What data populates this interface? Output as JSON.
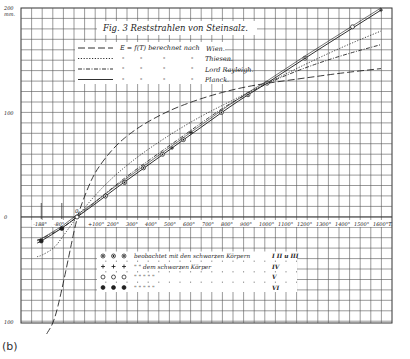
{
  "panel_label": "(b)",
  "chart_data": {
    "type": "line",
    "title": "Fig. 3 Reststrahlen von Steinsalz.",
    "xlabel": "T",
    "ylabel": "mm.",
    "xlim": [
      -220,
      1650
    ],
    "ylim": [
      -100,
      200
    ],
    "grid": true,
    "y_ticks": [
      {
        "value": 200,
        "label": "200"
      },
      {
        "value": 100,
        "label": "100"
      },
      {
        "value": 0,
        "label": "0"
      },
      {
        "value": -100,
        "label": "100"
      }
    ],
    "y_unit_label": "mm.",
    "x_ticks": [
      {
        "value": -188,
        "label": "-188°"
      },
      {
        "value": -80,
        "label": "-80°"
      },
      {
        "value": 0,
        "label": "0"
      },
      {
        "value": 100,
        "label": "+100°"
      },
      {
        "value": 200,
        "label": "200°"
      },
      {
        "value": 300,
        "label": "300°"
      },
      {
        "value": 400,
        "label": "400°"
      },
      {
        "value": 500,
        "label": "500°"
      },
      {
        "value": 600,
        "label": "600°"
      },
      {
        "value": 700,
        "label": "700°"
      },
      {
        "value": 800,
        "label": "800°"
      },
      {
        "value": 900,
        "label": "900°"
      },
      {
        "value": 1000,
        "label": "1000°"
      },
      {
        "value": 1100,
        "label": "1100°"
      },
      {
        "value": 1200,
        "label": "1200°"
      },
      {
        "value": 1300,
        "label": "1300°"
      },
      {
        "value": 1400,
        "label": "1400°"
      },
      {
        "value": 1500,
        "label": "1500°"
      },
      {
        "value": 1600,
        "label": "1600°T."
      }
    ],
    "legend": {
      "header": "E = f(T) berechnet nach",
      "entries": [
        {
          "style": "long-dash",
          "name": "Wien."
        },
        {
          "style": "dotted",
          "name": "Thiesen."
        },
        {
          "style": "dash-dot",
          "name": "Lord Rayleigh."
        },
        {
          "style": "solid",
          "name": "Planck."
        }
      ],
      "ditto_mark": "\""
    },
    "series": [
      {
        "name": "Wien",
        "style": "long-dash",
        "x": [
          -160,
          -120,
          -80,
          -40,
          0,
          50,
          100,
          200,
          300,
          400,
          500,
          600,
          700,
          800,
          900,
          1000,
          1200,
          1400,
          1600
        ],
        "y": [
          -112,
          -100,
          -70,
          -35,
          0,
          25,
          45,
          68,
          83,
          94,
          103,
          110,
          116,
          121,
          125,
          128,
          133,
          138,
          142
        ]
      },
      {
        "name": "Thiesen",
        "style": "dotted",
        "x": [
          -210,
          -188,
          -120,
          -80,
          -40,
          0,
          100,
          200,
          300,
          400,
          500,
          600,
          700,
          800,
          900,
          1000,
          1200,
          1400,
          1600
        ],
        "y": [
          -38,
          -37,
          -30,
          -20,
          -10,
          0,
          22,
          40,
          55,
          68,
          80,
          91,
          101,
          110,
          119,
          128,
          146,
          163,
          178
        ]
      },
      {
        "name": "Lord Rayleigh",
        "style": "dash-dot",
        "x": [
          -210,
          -188,
          -80,
          0,
          100,
          200,
          300,
          400,
          500,
          600,
          700,
          800,
          900,
          1000,
          1200,
          1400,
          1600
        ],
        "y": [
          -22,
          -21,
          -11,
          0,
          15,
          30,
          44,
          57,
          70,
          83,
          96,
          108,
          118,
          128,
          143,
          155,
          165
        ]
      },
      {
        "name": "Planck",
        "style": "solid",
        "x": [
          -210,
          -188,
          -80,
          0,
          100,
          200,
          300,
          400,
          500,
          600,
          700,
          800,
          900,
          1000,
          1200,
          1400,
          1600
        ],
        "y": [
          -25,
          -23,
          -11,
          0,
          13,
          27,
          40,
          53,
          66,
          79,
          92,
          105,
          117,
          128,
          152,
          175,
          198
        ]
      }
    ],
    "observations": {
      "legend_rows": [
        {
          "markers": [
            "◉",
            "◉",
            "◉"
          ],
          "text": "beobachtet mit den schwarzen Körpern",
          "roman": "I II u III"
        },
        {
          "markers": [
            "+",
            "+",
            "+"
          ],
          "text": "\"  \"  dem schwarzen Körper",
          "roman": "IV"
        },
        {
          "markers": [
            "○",
            "○",
            "○"
          ],
          "text": "\"  \"  \"  \"  \"",
          "roman": "V"
        },
        {
          "markers": [
            "●",
            "●",
            "●"
          ],
          "text": "\"  \"  \"  \"  \"",
          "roman": "VI"
        }
      ],
      "points": [
        {
          "x": -188,
          "y": -23,
          "marker": "●"
        },
        {
          "x": -80,
          "y": -11,
          "marker": "●"
        },
        {
          "x": 0,
          "y": 0,
          "marker": "○"
        },
        {
          "x": 150,
          "y": 20,
          "marker": "◉"
        },
        {
          "x": 250,
          "y": 33,
          "marker": "◉"
        },
        {
          "x": 350,
          "y": 47,
          "marker": "◉"
        },
        {
          "x": 450,
          "y": 60,
          "marker": "◉"
        },
        {
          "x": 500,
          "y": 66,
          "marker": "+"
        },
        {
          "x": 560,
          "y": 74,
          "marker": "◉"
        },
        {
          "x": 600,
          "y": 81,
          "marker": "+"
        },
        {
          "x": 760,
          "y": 100,
          "marker": "◉"
        },
        {
          "x": 900,
          "y": 117,
          "marker": "◉"
        },
        {
          "x": 1000,
          "y": 128,
          "marker": "◉"
        },
        {
          "x": 1200,
          "y": 152,
          "marker": "◉"
        },
        {
          "x": 1450,
          "y": 182,
          "marker": "○"
        },
        {
          "x": 1600,
          "y": 198,
          "marker": "+"
        }
      ]
    }
  }
}
